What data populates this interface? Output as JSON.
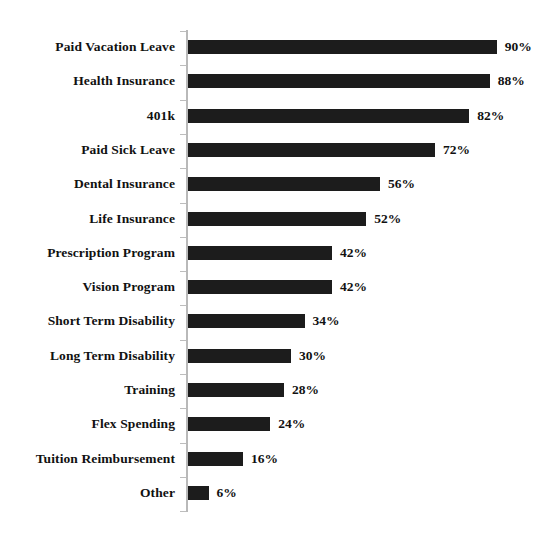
{
  "chart_data": {
    "type": "bar",
    "orientation": "horizontal",
    "title": "",
    "subtitle": "",
    "xlabel": "",
    "ylabel": "",
    "xlim": [
      0,
      100
    ],
    "grid": false,
    "legend": false,
    "value_suffix": "%",
    "bar_color": "#1c1c1c",
    "axis_color": "#b9b9b9",
    "text_color": "#111111",
    "categories": [
      "Paid Vacation Leave",
      "Health Insurance",
      "401k",
      "Paid Sick Leave",
      "Dental Insurance",
      "Life Insurance",
      "Prescription Program",
      "Vision Program",
      "Short Term Disability",
      "Long Term Disability",
      "Training",
      "Flex Spending",
      "Tuition Reimbursement",
      "Other"
    ],
    "values": [
      90,
      88,
      82,
      72,
      56,
      52,
      42,
      42,
      34,
      30,
      28,
      24,
      16,
      6
    ],
    "value_labels": [
      "90%",
      "88%",
      "82%",
      "72%",
      "56%",
      "52%",
      "42%",
      "42%",
      "34%",
      "30%",
      "28%",
      "24%",
      "16%",
      "6%"
    ]
  }
}
